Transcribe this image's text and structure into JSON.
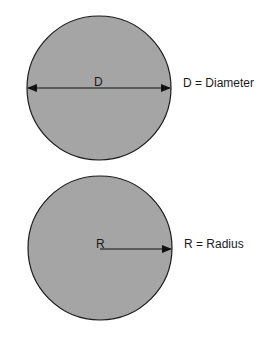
{
  "diagram": {
    "fill_color": "#a5a5a5",
    "stroke_color": "#1a1a1a",
    "diameter": {
      "inner_label": "D",
      "legend": "D = Diameter"
    },
    "radius": {
      "inner_label": "R",
      "legend": "R = Radius"
    }
  }
}
